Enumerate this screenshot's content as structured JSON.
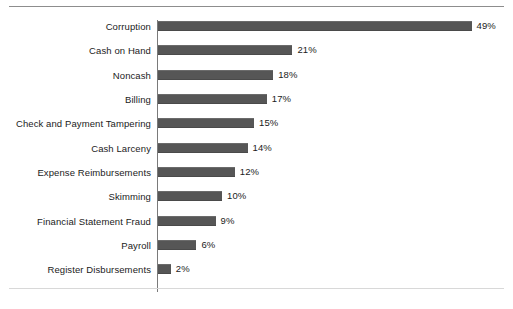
{
  "chart_data": {
    "type": "bar",
    "orientation": "horizontal",
    "title": "",
    "subtitle": "",
    "xlabel": "",
    "ylabel": "",
    "xlim": [
      0,
      49
    ],
    "grid": false,
    "legend": null,
    "value_suffix": "%",
    "bar_color": "#565656",
    "axis_color": "#7a7a7a",
    "text_color": "#1b1b1b",
    "px_per_percent": 6.4,
    "categories": [
      "Corruption",
      "Cash on Hand",
      "Noncash",
      "Billing",
      "Check and Payment Tampering",
      "Cash Larceny",
      "Expense Reimbursements",
      "Skimming",
      "Financial Statement Fraud",
      "Payroll",
      "Register Disbursements"
    ],
    "values": [
      49,
      21,
      18,
      17,
      15,
      14,
      12,
      10,
      9,
      6,
      2
    ],
    "value_labels": [
      "49%",
      "21%",
      "18%",
      "17%",
      "15%",
      "14%",
      "12%",
      "10%",
      "9%",
      "6%",
      "2%"
    ]
  }
}
